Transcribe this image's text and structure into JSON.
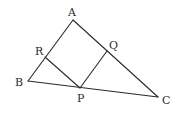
{
  "figure": {
    "type": "geometry",
    "points": {
      "A": {
        "x": 73,
        "y": 20,
        "label": "A",
        "lx": 68,
        "ly": 16
      },
      "B": {
        "x": 28,
        "y": 81,
        "label": "B",
        "lx": 15,
        "ly": 86
      },
      "C": {
        "x": 158,
        "y": 97,
        "label": "C",
        "lx": 162,
        "ly": 104
      },
      "R": {
        "x": 45,
        "y": 57,
        "label": "R",
        "lx": 35,
        "ly": 55
      },
      "Q": {
        "x": 107,
        "y": 51,
        "label": "Q",
        "lx": 109,
        "ly": 49
      },
      "P": {
        "x": 80,
        "y": 88,
        "label": "P",
        "lx": 77,
        "ly": 102
      }
    },
    "segments": [
      [
        "A",
        "B"
      ],
      [
        "A",
        "C"
      ],
      [
        "B",
        "C"
      ],
      [
        "R",
        "P"
      ],
      [
        "P",
        "Q"
      ]
    ],
    "labels": [
      "A",
      "B",
      "C",
      "R",
      "Q",
      "P"
    ]
  }
}
